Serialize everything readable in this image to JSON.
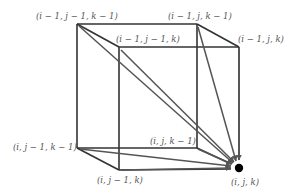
{
  "diagram": {
    "type": "cube-dependency",
    "colors": {
      "edge": "#333333",
      "arrow": "#555555",
      "label": "#555555",
      "target": "#000000"
    },
    "vertices": {
      "back_top_left": {
        "label": "(i − 1, j − 1, k − 1)",
        "x": 77,
        "y": 24
      },
      "back_top_right": {
        "label": "(i − 1, j, k − 1)",
        "x": 197,
        "y": 24
      },
      "front_top_left": {
        "label": "(i − 1, j − 1, k)",
        "x": 119,
        "y": 47
      },
      "front_top_right": {
        "label": "(i − 1, j, k)",
        "x": 239,
        "y": 47
      },
      "back_bottom_left": {
        "label": "(i, j − 1, k − 1)",
        "x": 77,
        "y": 148
      },
      "back_bottom_right": {
        "label": "(i, j, k − 1)",
        "x": 197,
        "y": 148
      },
      "front_bottom_left": {
        "label": "(i, j − 1, k)",
        "x": 119,
        "y": 170
      },
      "target": {
        "label": "(i, j, k)",
        "x": 239,
        "y": 168
      }
    },
    "arrows_to_target_from": [
      "back_top_left",
      "back_top_right",
      "front_top_left",
      "front_top_right",
      "back_bottom_left",
      "back_bottom_right",
      "front_bottom_left"
    ]
  }
}
